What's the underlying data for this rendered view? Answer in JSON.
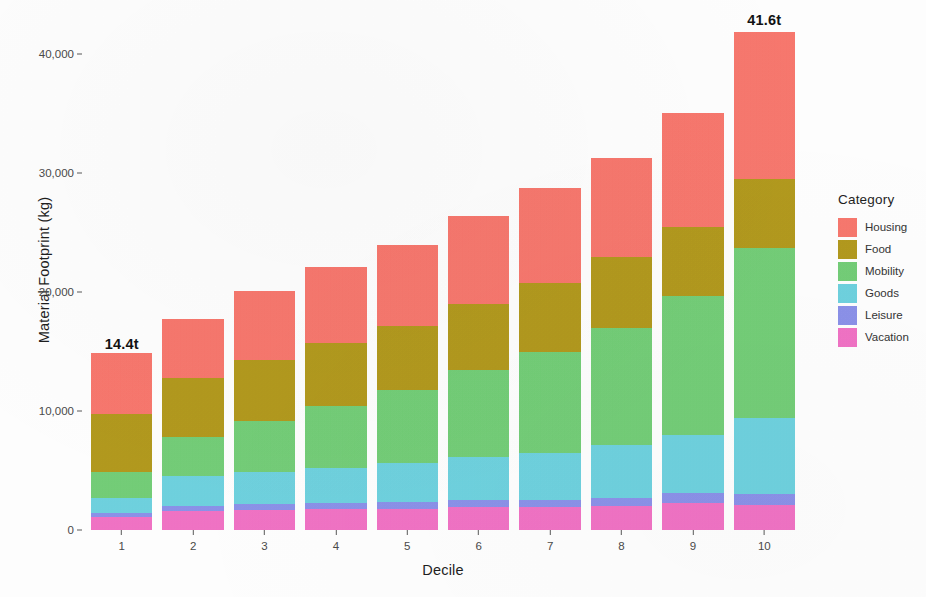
{
  "chart_data": {
    "type": "bar",
    "stacked": true,
    "title": "",
    "xlabel": "Decile",
    "ylabel": "Material Footprint (kg)",
    "categories": [
      "1",
      "2",
      "3",
      "4",
      "5",
      "6",
      "7",
      "8",
      "9",
      "10"
    ],
    "ylim": [
      0,
      43500
    ],
    "ytick_values": [
      0,
      10000,
      20000,
      30000,
      40000
    ],
    "ytick_labels": [
      "0",
      "10,000",
      "20,000",
      "30,000",
      "40,000"
    ],
    "grid": false,
    "legend_position": "right",
    "legend_title": "Category",
    "series": [
      {
        "name": "Housing",
        "color": "#F8786E",
        "values": [
          5100,
          4900,
          5800,
          6400,
          6800,
          7400,
          8000,
          8300,
          9600,
          12300
        ]
      },
      {
        "name": "Food",
        "color": "#B39A1E",
        "values": [
          4900,
          5000,
          5100,
          5300,
          5400,
          5600,
          5800,
          5900,
          5800,
          5800
        ]
      },
      {
        "name": "Mobility",
        "color": "#74CE78",
        "values": [
          2200,
          3300,
          4300,
          5200,
          6100,
          7300,
          8500,
          9900,
          11700,
          14300
        ]
      },
      {
        "name": "Goods",
        "color": "#6FD2DF",
        "values": [
          1200,
          2500,
          2700,
          2900,
          3300,
          3600,
          3900,
          4400,
          4800,
          6400
        ]
      },
      {
        "name": "Leisure",
        "color": "#8C92E9",
        "values": [
          350,
          400,
          450,
          500,
          550,
          600,
          650,
          700,
          850,
          900
        ]
      },
      {
        "name": "Vacation",
        "color": "#F173C5",
        "values": [
          1100,
          1600,
          1700,
          1800,
          1800,
          1900,
          1900,
          2000,
          2300,
          2100
        ]
      }
    ],
    "totals": [
      14400,
      17700,
      19800,
      21700,
      23400,
      25600,
      27700,
      30000,
      33300,
      41600
    ],
    "annotations": [
      {
        "category": "1",
        "text": "14.4t",
        "value": 14400
      },
      {
        "category": "10",
        "text": "41.6t",
        "value": 41600
      }
    ]
  },
  "axes": {
    "y_title": "Material Footprint (kg)",
    "x_title": "Decile"
  },
  "legend": {
    "title": "Category",
    "items": [
      {
        "label": "Housing",
        "color": "#F8786E"
      },
      {
        "label": "Food",
        "color": "#B39A1E"
      },
      {
        "label": "Mobility",
        "color": "#74CE78"
      },
      {
        "label": "Goods",
        "color": "#6FD2DF"
      },
      {
        "label": "Leisure",
        "color": "#8C92E9"
      },
      {
        "label": "Vacation",
        "color": "#F173C5"
      }
    ]
  }
}
